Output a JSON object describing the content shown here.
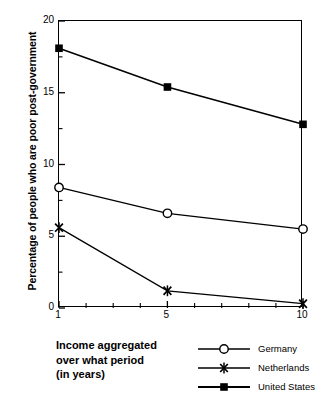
{
  "chart_data": {
    "type": "line",
    "title": "",
    "xlabel": "Income aggregated over what period (in years)",
    "ylabel": "Percentage of people who are poor post-government",
    "x": [
      1,
      5,
      10
    ],
    "xlim": [
      1,
      10
    ],
    "ylim": [
      0,
      20
    ],
    "xticks": [
      1,
      2,
      3,
      4,
      5,
      6,
      7,
      8,
      9,
      10
    ],
    "xtick_labels": [
      "1",
      "",
      "",
      "",
      "5",
      "",
      "",
      "",
      "",
      "10"
    ],
    "yticks": [
      0,
      5,
      10,
      15,
      20
    ],
    "ytick_labels": [
      "0",
      "5",
      "10",
      "15",
      "20"
    ],
    "y_minor_ticks": [
      2.5,
      7.5,
      12.5,
      17.5
    ],
    "grid": false,
    "legend_position": "bottom-right",
    "series": [
      {
        "name": "Germany",
        "marker": "open-circle",
        "values": [
          8.4,
          6.6,
          5.5
        ]
      },
      {
        "name": "Netherlands",
        "marker": "star-x",
        "values": [
          5.6,
          1.2,
          0.3
        ]
      },
      {
        "name": "United States",
        "marker": "filled-square",
        "values": [
          18.1,
          15.4,
          12.8
        ]
      }
    ]
  },
  "axis": {
    "y_title": "Percentage of people who are poor post-government",
    "y_tick_labels": [
      "20",
      "15",
      "10",
      "5",
      "0"
    ],
    "x_tick_labels": [
      "1",
      "5",
      "10"
    ]
  },
  "caption": {
    "line1": "Income aggregated",
    "line2": "over what period",
    "line3": "(in years)"
  },
  "legend": {
    "entries": [
      {
        "label": "Germany",
        "marker": "open-circle"
      },
      {
        "label": "Netherlands",
        "marker": "star-x"
      },
      {
        "label": "United States",
        "marker": "filled-square"
      }
    ]
  },
  "colors": {
    "line": "#000000",
    "background": "#ffffff",
    "axis": "#000000"
  }
}
